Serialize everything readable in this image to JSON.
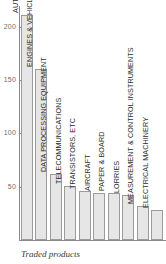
{
  "chart_data": {
    "type": "bar",
    "title": "",
    "subtitle": "",
    "xlabel": "Traded products",
    "ylabel": "",
    "ylim": [
      0,
      220
    ],
    "grid": false,
    "legend": null,
    "ticks": [
      {
        "value": 200,
        "label": "200"
      },
      {
        "value": 150,
        "label": "150"
      },
      {
        "value": 100,
        "label": "100"
      },
      {
        "value": 50,
        "label": "50"
      }
    ],
    "categories": [
      "AUTOMOBILES",
      "ENGINES & VEHICLE PARTS",
      "DATA PROCESSING EQUIPMENT",
      "TELECOMMUNICATIONS",
      "TRANSISTORS, ETC",
      "AIRCRAFT",
      "PAPER & BOARD",
      "LORRIES",
      "MEASUREMENT & CONTROL INSTRUMENTS",
      "ELECTRICAL MACHINERY"
    ],
    "values": [
      211,
      160,
      62,
      51,
      46,
      44,
      44,
      42,
      32,
      28
    ],
    "bar_fill": "#e6e6e6",
    "bar_stroke": "#9b9b9b",
    "axis_color": "#8a8a8a",
    "label_color": "#2b2b2b",
    "tick_label_color": "#6d6d6d"
  },
  "caption": {
    "text": "Traded products"
  }
}
